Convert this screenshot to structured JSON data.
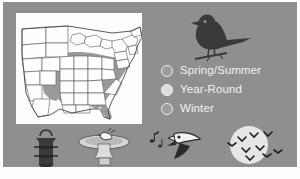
{
  "graphic": {
    "title_visible": false,
    "background_color": "#8f8f8f",
    "panel_color": "#fdfdfd"
  },
  "map": {
    "name": "us-range-map",
    "region": "Eastern and Southeastern United States",
    "fill_shaded": "#9a9a9a",
    "fill_unshaded": "#fdfdfd",
    "border_color": "#4a4a4a",
    "shaded_states": [
      "Texas (east)",
      "Oklahoma (east)",
      "Kansas (east)",
      "Missouri",
      "Arkansas",
      "Louisiana",
      "Mississippi",
      "Alabama",
      "Georgia",
      "Florida (north)",
      "South Carolina",
      "North Carolina",
      "Tennessee",
      "Kentucky",
      "Virginia",
      "West Virginia",
      "Maryland",
      "Delaware",
      "Illinois",
      "Indiana",
      "Ohio",
      "Iowa (south)"
    ]
  },
  "bird_silhouette": {
    "name": "perched-bird-silhouette",
    "color": "#3a3a3a",
    "description": "dark songbird perched on a branch"
  },
  "legend": {
    "items": [
      {
        "label": "Spring/Summer",
        "swatch_color": "#9d9d9d",
        "icon": "circle-icon"
      },
      {
        "label": "Year-Round",
        "swatch_color": "#dedede",
        "icon": "circle-icon"
      },
      {
        "label": "Winter",
        "swatch_color": "#9d9d9d",
        "icon": "circle-icon"
      }
    ],
    "text_color": "#f2f2f2"
  },
  "icons": [
    {
      "name": "bird-feeder-icon",
      "label": "tube bird feeder"
    },
    {
      "name": "birdbath-icon",
      "label": "pedestal birdbath with bathing bird"
    },
    {
      "name": "singing-bird-icon",
      "label": "bird head singing with music notes"
    },
    {
      "name": "migration-moon-icon",
      "label": "flock of birds flying across the moon"
    }
  ]
}
